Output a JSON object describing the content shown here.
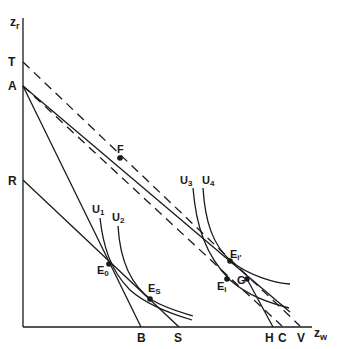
{
  "figure": {
    "type": "economics indifference-curve / budget-line diagram",
    "axes": {
      "y_label": "z",
      "y_label_sub": "r",
      "x_label": "z",
      "x_label_sub": "w"
    },
    "vertical_axis_points": [
      {
        "id": "T",
        "label": "T"
      },
      {
        "id": "A",
        "label": "A"
      },
      {
        "id": "R",
        "label": "R"
      }
    ],
    "horizontal_axis_points": [
      {
        "id": "B",
        "label": "B"
      },
      {
        "id": "S",
        "label": "S"
      },
      {
        "id": "H",
        "label": "H"
      },
      {
        "id": "C",
        "label": "C"
      },
      {
        "id": "V",
        "label": "V"
      }
    ],
    "indifference_curves": [
      {
        "id": "U1",
        "label": "U",
        "sub": "1"
      },
      {
        "id": "U2",
        "label": "U",
        "sub": "2"
      },
      {
        "id": "U3",
        "label": "U",
        "sub": "3"
      },
      {
        "id": "U4",
        "label": "U",
        "sub": "4"
      }
    ],
    "equilibrium_points": [
      {
        "id": "F",
        "label": "F"
      },
      {
        "id": "E0",
        "label": "E",
        "sub": "0"
      },
      {
        "id": "ES",
        "label": "E",
        "sub": "S"
      },
      {
        "id": "Ei",
        "label": "E",
        "sub": "i"
      },
      {
        "id": "Ei_prime",
        "label": "E",
        "sub": "i′"
      },
      {
        "id": "G",
        "label": "G"
      }
    ],
    "lines": [
      {
        "from": "A",
        "to": "B",
        "style": "solid"
      },
      {
        "from": "R",
        "to": "S",
        "style": "solid"
      },
      {
        "from": "A",
        "to": "C",
        "style": "solid",
        "through": "F"
      },
      {
        "from": "T",
        "to": "V",
        "style": "dashed"
      },
      {
        "from": "A",
        "to": "H-region",
        "style": "dashed"
      },
      {
        "from": "G",
        "to": "H",
        "style": "solid"
      }
    ],
    "colors": {
      "ink": "#1a1a1a",
      "background": "#ffffff"
    }
  }
}
